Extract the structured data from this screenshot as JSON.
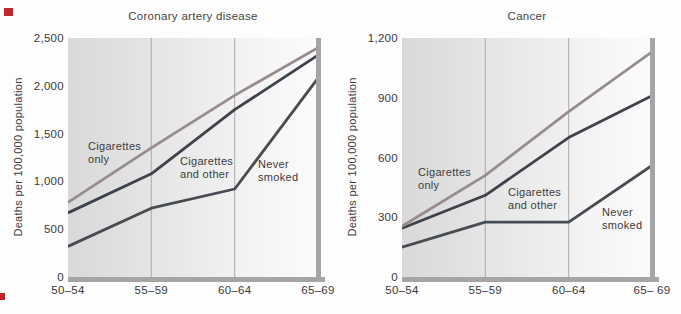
{
  "accents": {
    "registration_mark_color": "#c0272d",
    "axis_border_color": "#a5a5a5",
    "gridline_color": "#ababab"
  },
  "chart_data": [
    {
      "type": "line",
      "title": "Coronary artery disease",
      "ylabel": "Deaths per 100,000 population",
      "xlabel": "",
      "categories": [
        "50–54",
        "55–59",
        "60–64",
        "65–69"
      ],
      "ylim": [
        0,
        2500
      ],
      "yticks": [
        "0",
        "500",
        "1,000",
        "1,500",
        "2,000",
        "2,500"
      ],
      "grid": "vertical gridlines at 55–59 and 60–64",
      "legend_position": "labels drawn inside plot next to lines",
      "series": [
        {
          "name": "Cigarettes only",
          "label_lines": [
            "Cigarettes",
            "only"
          ],
          "values": [
            780,
            1350,
            1900,
            2400
          ],
          "color": "#988c8c"
        },
        {
          "name": "Cigarettes and other",
          "label_lines": [
            "Cigarettes",
            "and other"
          ],
          "values": [
            670,
            1080,
            1750,
            2320
          ],
          "color": "#3e434b"
        },
        {
          "name": "Never smoked",
          "label_lines": [
            "Never",
            "smoked"
          ],
          "values": [
            320,
            720,
            920,
            2080
          ],
          "color": "#474c52"
        }
      ]
    },
    {
      "type": "line",
      "title": "Cancer",
      "ylabel": "Deaths per 100,000 population",
      "xlabel": "",
      "categories": [
        "50–54",
        "55–59",
        "60–64",
        "65– 69"
      ],
      "ylim": [
        0,
        1200
      ],
      "yticks": [
        "0",
        "300",
        "600",
        "900",
        "1,200"
      ],
      "grid": "vertical gridlines at 55–59 and 60–64",
      "legend_position": "labels drawn inside plot next to lines",
      "series": [
        {
          "name": "Cigarettes only",
          "label_lines": [
            "Cigarettes",
            "only"
          ],
          "values": [
            255,
            510,
            830,
            1130
          ],
          "color": "#988c8c"
        },
        {
          "name": "Cigarettes and other",
          "label_lines": [
            "Cigarettes",
            "and other"
          ],
          "values": [
            245,
            410,
            700,
            910
          ],
          "color": "#3e434b"
        },
        {
          "name": "Never smoked",
          "label_lines": [
            "Never",
            "smoked"
          ],
          "values": [
            150,
            275,
            275,
            560
          ],
          "color": "#474c52"
        }
      ]
    }
  ]
}
